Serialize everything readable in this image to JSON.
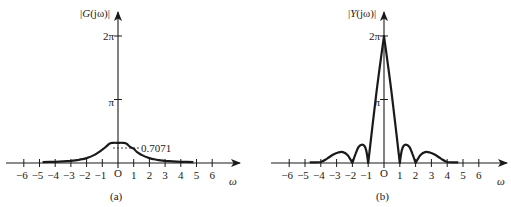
{
  "colors": {
    "ink": "#1a1a1a",
    "background": "#ffffff"
  },
  "chart_data": [
    {
      "type": "line",
      "panel_label": "(a)",
      "title": "",
      "ylabel": "|G(jω)|",
      "xlabel": "ω",
      "xticks": [
        -6,
        -5,
        -4,
        -3,
        -2,
        -1,
        0,
        1,
        2,
        3,
        4,
        5,
        6
      ],
      "xtick_labels": [
        "−6",
        "−5",
        "−4",
        "−3",
        "−2",
        "−1",
        "O",
        "1",
        "2",
        "3",
        "4",
        "5",
        "6"
      ],
      "yticks": [
        3.14159,
        6.28319
      ],
      "ytick_labels": [
        "π",
        "2π"
      ],
      "annotation": {
        "text": "0.7071",
        "x": 1,
        "y": 0.7071,
        "style": "dashed-leader"
      },
      "xlim": [
        -7.2,
        7.7
      ],
      "ylim": [
        0,
        7.0
      ],
      "grid": false,
      "series": [
        {
          "name": "|G(jω)|",
          "x": [
            -4.8,
            -4.0,
            -3.5,
            -3.0,
            -2.5,
            -2.0,
            -1.5,
            -1.2,
            -1.0,
            -0.8,
            -0.6,
            -0.5,
            -0.3,
            0,
            0.3,
            0.5,
            0.6,
            0.8,
            1.0,
            1.2,
            1.5,
            2.0,
            2.5,
            3.0,
            3.5,
            4.0,
            4.8
          ],
          "y": [
            0.04,
            0.06,
            0.08,
            0.11,
            0.16,
            0.24,
            0.4,
            0.55,
            0.66,
            0.78,
            0.92,
            0.98,
            1.0,
            1.0,
            1.0,
            0.98,
            0.92,
            0.78,
            0.7071,
            0.55,
            0.4,
            0.24,
            0.16,
            0.11,
            0.08,
            0.06,
            0.04
          ]
        }
      ]
    },
    {
      "type": "line",
      "panel_label": "(b)",
      "title": "",
      "ylabel": "|Y(jω)|",
      "xlabel": "ω",
      "xticks": [
        -6,
        -5,
        -4,
        -3,
        -2,
        -1,
        0,
        1,
        2,
        3,
        4,
        5,
        6
      ],
      "xtick_labels": [
        "−6",
        "−5",
        "−4",
        "−3",
        "−2",
        "−1",
        "O",
        "1",
        "2",
        "3",
        "4",
        "5",
        "6"
      ],
      "yticks": [
        3.14159,
        6.28319
      ],
      "ytick_labels": [
        "π",
        "2π"
      ],
      "xlim": [
        -7.2,
        7.7
      ],
      "ylim": [
        0,
        7.0
      ],
      "grid": false,
      "series": [
        {
          "name": "|Y(jω)|",
          "x": [
            -4.7,
            -4.0,
            -3.6,
            -3.2,
            -2.9,
            -2.6,
            -2.3,
            -2.0,
            -1.8,
            -1.6,
            -1.35,
            -1.15,
            -1.0,
            -0.5,
            0,
            0.5,
            1.0,
            1.15,
            1.35,
            1.6,
            1.8,
            2.0,
            2.3,
            2.6,
            2.9,
            3.2,
            3.6,
            4.0,
            4.7
          ],
          "y": [
            0.03,
            0.05,
            0.22,
            0.42,
            0.52,
            0.54,
            0.38,
            0.0,
            0.45,
            0.8,
            0.9,
            0.7,
            0.0,
            3.35,
            6.28,
            3.35,
            0.0,
            0.7,
            0.9,
            0.8,
            0.45,
            0.0,
            0.38,
            0.54,
            0.52,
            0.42,
            0.22,
            0.05,
            0.03
          ]
        }
      ]
    }
  ],
  "panels": [
    {
      "label": "(a)",
      "ylabel_prefix": "|",
      "ylabel_func": "G",
      "ylabel_arg": "(jω)|",
      "xlabel": "ω",
      "annotation": "0.7071",
      "origin": "O"
    },
    {
      "label": "(b)",
      "ylabel_prefix": "|",
      "ylabel_func": "Y",
      "ylabel_arg": "(jω)|",
      "xlabel": "ω",
      "origin": "O"
    }
  ]
}
